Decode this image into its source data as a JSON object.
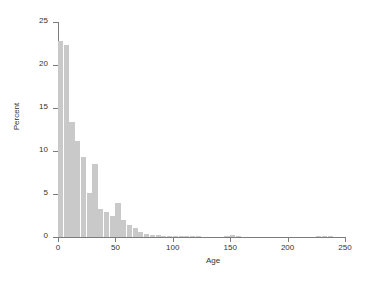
{
  "chart_data": {
    "type": "bar",
    "title": "",
    "subtitle": "",
    "xlabel": "Age",
    "ylabel": "Percent",
    "xlim": [
      0,
      250
    ],
    "ylim": [
      0,
      25
    ],
    "xticks": [
      0,
      50,
      100,
      150,
      200,
      250
    ],
    "yticks": [
      0,
      5,
      10,
      15,
      20,
      25
    ],
    "xtick_labels": [
      "0",
      "50",
      "100",
      "150",
      "200",
      "250"
    ],
    "ytick_labels": [
      "0",
      "5",
      "10",
      "15",
      "20",
      "25"
    ],
    "grid": false,
    "legend": null,
    "bar_color": "#c9c9c9",
    "axis_color": "#7c7c7c",
    "text_color": "#333333",
    "background_color": "#ffffff",
    "bin_width": 5,
    "series": [
      {
        "name": "Age distribution",
        "bin_starts": [
          0,
          5,
          10,
          15,
          20,
          25,
          30,
          35,
          40,
          45,
          50,
          55,
          60,
          65,
          70,
          75,
          80,
          85,
          90,
          95,
          100,
          105,
          110,
          115,
          120,
          145,
          150,
          155,
          225,
          230,
          235
        ],
        "values": [
          22.8,
          22.3,
          13.4,
          11.2,
          9.3,
          5.1,
          8.5,
          3.2,
          2.9,
          2.5,
          4.0,
          2.0,
          1.4,
          1.0,
          0.6,
          0.3,
          0.25,
          0.2,
          0.15,
          0.12,
          0.1,
          0.1,
          0.1,
          0.08,
          0.08,
          0.06,
          0.2,
          0.06,
          0.06,
          0.06,
          0.06
        ]
      }
    ]
  }
}
